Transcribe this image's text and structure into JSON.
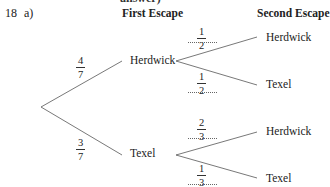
{
  "cutoff_text": "answer)",
  "question": {
    "number": "18",
    "part": "a)"
  },
  "headers": {
    "first": "First Escape",
    "second": "Second Escape"
  },
  "tree": {
    "first_level": [
      {
        "label": "Herdwick",
        "prob": {
          "num": "4",
          "den": "7"
        }
      },
      {
        "label": "Texel",
        "prob": {
          "num": "3",
          "den": "7"
        }
      }
    ],
    "second_level": {
      "from_herdwick": [
        {
          "label": "Herdwick",
          "prob": {
            "num": "1",
            "den": "2"
          }
        },
        {
          "label": "Texel",
          "prob": {
            "num": "1",
            "den": "2"
          }
        }
      ],
      "from_texel": [
        {
          "label": "Herdwick",
          "prob": {
            "num": "2",
            "den": "3"
          }
        },
        {
          "label": "Texel",
          "prob": {
            "num": "1",
            "den": "3"
          }
        }
      ]
    }
  },
  "colors": {
    "line": "#555555",
    "text": "#222222"
  }
}
